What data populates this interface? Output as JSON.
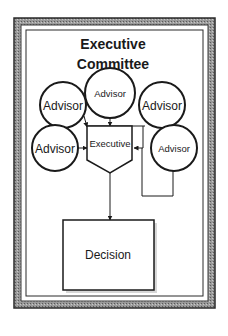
{
  "diagram": {
    "title_line1": "Executive",
    "title_line2": "Committee",
    "nodes": {
      "advisor_top": "Advisor",
      "advisor_left_top": "Advisor",
      "advisor_right_top": "Advisor",
      "advisor_left_mid": "Advisor",
      "advisor_right_mid": "Advisor",
      "executive": "Executive",
      "decision": "Decision"
    },
    "colors": {
      "stroke": "#1a1a1a",
      "frame": "#8a8a8a",
      "background": "#ffffff"
    }
  }
}
